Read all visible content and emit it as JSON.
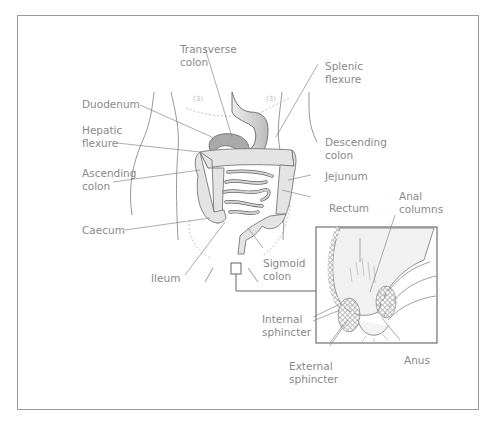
{
  "figure": {
    "type": "anatomical-diagram",
    "colors": {
      "frame": "#9a9a9a",
      "label_text": "#8a8a8a",
      "line": "#777777",
      "organ_fill": "#e6e6e6",
      "organ_shade": "#bdbdbd"
    }
  },
  "labels": {
    "transverse_colon": "Transverse\ncolon",
    "splenic_flexure": "Splenic\nflexure",
    "duodenum": "Duodenum",
    "hepatic_flexure": "Hepatic\nflexure",
    "descending_colon": "Descending\ncolon",
    "ascending_colon": "Ascending\ncolon",
    "jejunum": "Jejunum",
    "caecum": "Caecum",
    "ileum": "Ileum",
    "sigmoid_colon": "Sigmoid\ncolon",
    "rectum": "Rectum",
    "anal_columns": "Anal\ncolumns",
    "internal_sphincter": "Internal\nsphincter",
    "external_sphincter": "External\nsphincter",
    "anus": "Anus"
  },
  "inset": {
    "description": "enlarged cross-section of rectum and anal canal"
  }
}
